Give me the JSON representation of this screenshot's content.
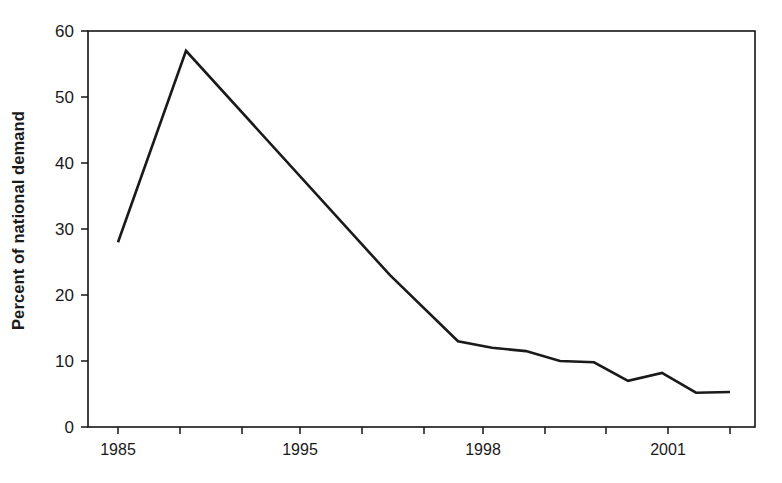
{
  "chart_data": {
    "type": "line",
    "title": "",
    "xlabel": "",
    "ylabel": "Percent of national demand",
    "ylim": [
      0,
      60
    ],
    "yticks": [
      0,
      10,
      20,
      30,
      40,
      50,
      60
    ],
    "ytick_labels": [
      "0",
      "10",
      "20",
      "30",
      "40",
      "50",
      "60"
    ],
    "xlim": [
      1985,
      2003
    ],
    "xticks": [
      1985,
      1986,
      1987,
      1988,
      1989,
      1990,
      1991,
      1992,
      1993,
      1994,
      1995,
      1996,
      1997,
      1998,
      1999,
      2000,
      2001,
      2002
    ],
    "xtick_labels_shown": [
      "1985",
      "1995",
      "1998",
      "2001"
    ],
    "xtick_labeled_values": [
      1985,
      1995,
      1998,
      2001
    ],
    "grid": false,
    "legend": null,
    "series": [
      {
        "name": "Percent of national demand",
        "x": [
          1985,
          1986,
          1987,
          1988,
          1989,
          1990,
          1991,
          1992,
          1993,
          1994,
          1995,
          1996,
          1997,
          1998,
          1999,
          2000,
          2001,
          2002
        ],
        "values": [
          28,
          57,
          23,
          13,
          12,
          11.5,
          11.3,
          11,
          10,
          9.8,
          7,
          8.2,
          5.2,
          5.3,
          null,
          null,
          null,
          null
        ]
      }
    ],
    "points": [
      {
        "x": 1985,
        "y": 28
      },
      {
        "x": 1987,
        "y": 57
      },
      {
        "x": 1993,
        "y": 23
      },
      {
        "x": 1995,
        "y": 13
      },
      {
        "x": 1996,
        "y": 12
      },
      {
        "x": 1997,
        "y": 11.5
      },
      {
        "x": 1998,
        "y": 10
      },
      {
        "x": 1999,
        "y": 9.8
      },
      {
        "x": 2000,
        "y": 7
      },
      {
        "x": 2001,
        "y": 8.2
      },
      {
        "x": 2002,
        "y": 5.2
      },
      {
        "x": 2003,
        "y": 5.3
      }
    ],
    "colors": {
      "line": "#1a1a1a",
      "axis": "#141414",
      "background": "#ffffff",
      "text": "#1a1a1a"
    }
  },
  "axis": {
    "y_ticks": [
      {
        "label": "60"
      },
      {
        "label": "50"
      },
      {
        "label": "40"
      },
      {
        "label": "30"
      },
      {
        "label": "20"
      },
      {
        "label": "10"
      },
      {
        "label": "0"
      }
    ],
    "x_ticks": [
      {
        "label": "1985"
      },
      {
        "label": "1995"
      },
      {
        "label": "1998"
      },
      {
        "label": "2001"
      }
    ],
    "y_axis_title": "Percent of national demand"
  }
}
